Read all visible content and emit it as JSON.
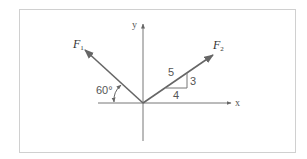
{
  "figure": {
    "frame": {
      "x": 19,
      "y": 9,
      "width": 276,
      "height": 143,
      "border_color": "#d0d0d0"
    },
    "colors": {
      "axis": "#777777",
      "vector": "#666666",
      "text": "#555555"
    },
    "axes": {
      "origin": [
        143,
        103
      ],
      "x_label": "x",
      "y_label": "y"
    },
    "vectors": [
      {
        "name": "F1",
        "label_main": "F",
        "label_sub": "1",
        "angle_from_negative_x_deg": 60
      },
      {
        "name": "F2",
        "label_main": "F",
        "label_sub": "2",
        "slope": {
          "hyp": "5",
          "rise": "3",
          "run": "4"
        }
      }
    ],
    "annotations": {
      "angle_label": "60°",
      "slope_hyp": "5",
      "slope_rise": "3",
      "slope_run": "4"
    }
  }
}
